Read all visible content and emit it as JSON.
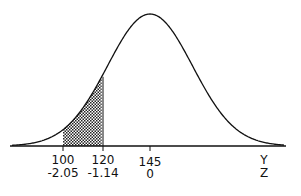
{
  "chart_data": {
    "type": "area",
    "title": "",
    "distribution": {
      "mean": 145,
      "sd": 22
    },
    "shaded_region": {
      "from": 100,
      "to": 120
    },
    "x_ticks": [
      {
        "y": "100",
        "z": "-2.05"
      },
      {
        "y": "120",
        "z": "-1.14"
      },
      {
        "y": "145",
        "z": "0"
      }
    ],
    "axis_labels": {
      "y": "Y",
      "z": "Z"
    },
    "xlabel": "Y / Z",
    "ylabel": "",
    "grid": false,
    "legend": "none"
  },
  "labels": {
    "t100_y": "100",
    "t100_z": "-2.05",
    "t120_y": "120",
    "t120_z": "-1.14",
    "t145_y": "145",
    "t145_z": "0",
    "axis_y": "Y",
    "axis_z": "Z"
  },
  "colors": {
    "line": "#111111",
    "shade": "#9a9a9a"
  }
}
